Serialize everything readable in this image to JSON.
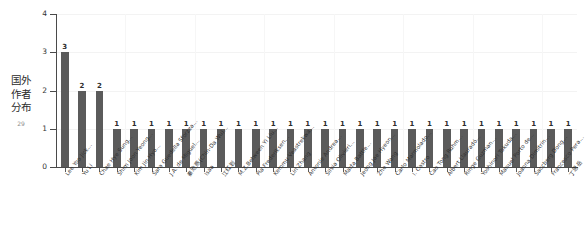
{
  "side_caption": {
    "text": "国外作者分布",
    "page_number": "29"
  },
  "chart_data": {
    "type": "bar",
    "title": "",
    "xlabel": "",
    "ylabel": "文献数（篇）",
    "ylim": [
      0,
      4
    ],
    "yticks": [
      "0",
      "1",
      "2",
      "3",
      "4"
    ],
    "grid": true,
    "legend": "none",
    "orientation": "vertical",
    "bar_color": "#5b5b5b",
    "categories": [
      "Lee Yoo Jick…",
      "Yu Li",
      "Chae Hye Sung…",
      "Shim Joon Yeong…",
      "Kim Jin Hyo…",
      "Sara Guedella Sforzza…",
      "J.A. de Miguel…",
      "秦池燕(Chin-Da Wu)…",
      "Isaa",
      "江红岩",
      "M.Z.Between Yi Liu…",
      "Pia Frederiksen…",
      "Kemmu Veastrekwa…",
      "Lin Zhang",
      "Antonie Andrea…",
      "Silvia Olivieri…",
      "Marta Battle…",
      "Jeong Jae Hyeon…",
      "Zhe Wang",
      "Carlo Marmolado…",
      "I. Castro",
      "Cao Tong Ruhm…",
      "Albert Llauradó…",
      "Ringe Guzman…",
      "Yoshinori Tokuda…",
      "Manuel Porto de…",
      "Joanna Dimitrin…",
      "Saccberg Dong…",
      "Francesco Pera…",
      "丁思岳"
    ],
    "values": [
      3,
      2,
      2,
      1,
      1,
      1,
      1,
      1,
      1,
      1,
      1,
      1,
      1,
      1,
      1,
      1,
      1,
      1,
      1,
      1,
      1,
      1,
      1,
      1,
      1,
      1,
      1,
      1,
      1,
      1
    ],
    "value_labels": [
      "3",
      "2",
      "2",
      "1",
      "1",
      "1",
      "1",
      "1",
      "1",
      "1",
      "1",
      "1",
      "1",
      "1",
      "1",
      "1",
      "1",
      "1",
      "1",
      "1",
      "1",
      "1",
      "1",
      "1",
      "1",
      "1",
      "1",
      "1",
      "1",
      "1"
    ]
  }
}
